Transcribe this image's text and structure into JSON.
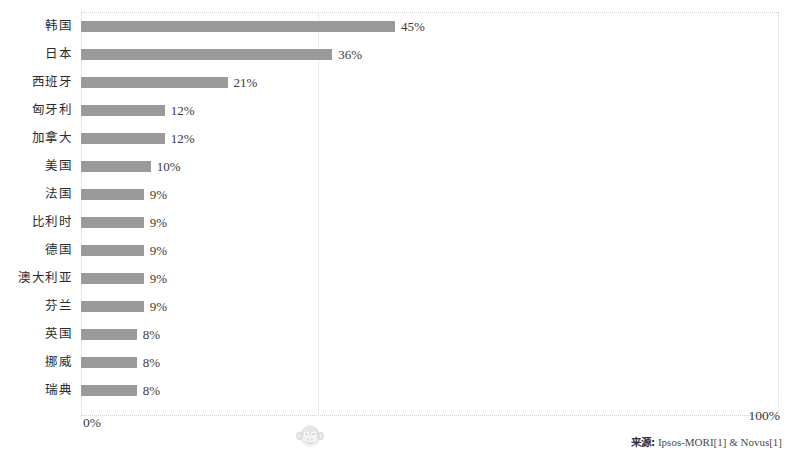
{
  "chart_data": {
    "type": "bar",
    "orientation": "horizontal",
    "title": "",
    "subtitle": "",
    "xlabel": "",
    "ylabel": "",
    "xlim": [
      0,
      100
    ],
    "xtick_labels": [
      "0%",
      "100%"
    ],
    "grid": true,
    "gridline_positions": [
      34
    ],
    "legend": null,
    "value_suffix": "%",
    "categories": [
      "韩国",
      "日本",
      "西班牙",
      "匈牙利",
      "加拿大",
      "美国",
      "法国",
      "比利时",
      "德国",
      "澳大利亚",
      "芬兰",
      "英国",
      "挪威",
      "瑞典"
    ],
    "values": [
      45,
      36,
      21,
      12,
      12,
      10,
      9,
      9,
      9,
      9,
      9,
      8,
      8,
      8
    ],
    "data_labels": [
      "45%",
      "36%",
      "21%",
      "12%",
      "12%",
      "10%",
      "9%",
      "9%",
      "9%",
      "9%",
      "9%",
      "8%",
      "8%",
      "8%"
    ],
    "series": [
      {
        "name": "",
        "values": [
          45,
          36,
          21,
          12,
          12,
          10,
          9,
          9,
          9,
          9,
          9,
          8,
          8,
          8
        ]
      }
    ]
  },
  "axis": {
    "min_label": "0%",
    "max_label": "100%"
  },
  "source": {
    "label": "来源:",
    "text": "Ipsos-MORI[1] & Novus[1]",
    "full": "来源: Ipsos-MORI[1] & Novus[1]"
  },
  "watermark": {
    "icon": "monkey-face-icon",
    "glyph": "🐵"
  },
  "colors": {
    "bar": "#9a9a9a",
    "grid": "#d8d8d8",
    "frame": "#d2d2d2",
    "label_text": "#2b2b2b",
    "value_text": "#3a3a3a",
    "background": "#ffffff"
  }
}
